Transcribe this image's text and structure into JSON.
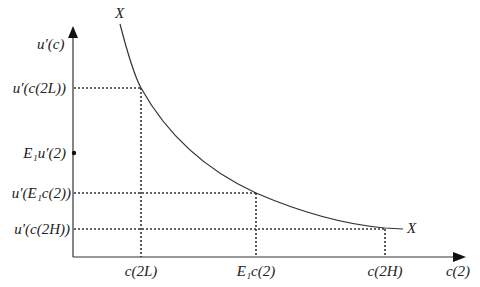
{
  "diagram": {
    "y_axis_label": "u′(c)",
    "x_axis_label": "c(2)",
    "curve_label_top": "X",
    "curve_label_end": "X",
    "y_ticks": [
      {
        "label": "u′(c(2L))",
        "y": 88
      },
      {
        "label": "E₁u′(2)",
        "y": 153,
        "marker": "dot"
      },
      {
        "label": "u′(E₁c(2))",
        "y": 193
      },
      {
        "label": "u′(c(2H))",
        "y": 229
      }
    ],
    "x_ticks": [
      {
        "label": "c(2L)",
        "x": 141
      },
      {
        "label": "E₁c(2)",
        "x": 256
      },
      {
        "label": "c(2H)",
        "x": 385
      }
    ],
    "colors": {
      "line": "#333333",
      "text": "#222222"
    }
  }
}
